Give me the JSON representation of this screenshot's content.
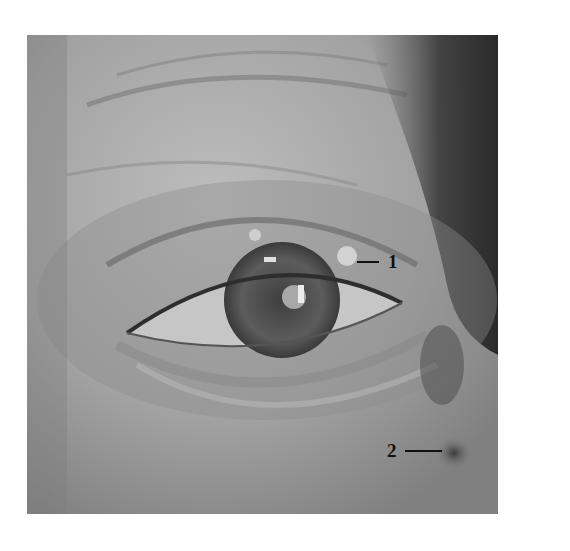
{
  "figure": {
    "photo_bounds": {
      "x": 27,
      "y": 35,
      "width": 471,
      "height": 479
    },
    "annotations": [
      {
        "id": "1",
        "label": "1",
        "side": "right-of-leader",
        "target": "small nodule on upper eyelid margin"
      },
      {
        "id": "2",
        "label": "2",
        "side": "left-of-leader",
        "target": "dark lesion near lower lateral canthus / cheek"
      }
    ],
    "colors": {
      "background": "#ffffff",
      "skin_light": "#b8b8b8",
      "skin_mid": "#9a9a9a",
      "shadow": "#4a4a4a",
      "hair": "#2e2e2e",
      "iris": "#5a5a5a",
      "sclera": "#c8c8c8",
      "label": "#111111"
    }
  }
}
